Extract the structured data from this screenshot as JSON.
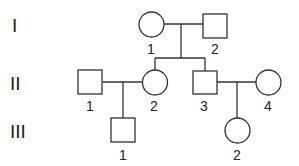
{
  "diagram": {
    "type": "pedigree",
    "colors": {
      "stroke": "#333333",
      "text": "#222222",
      "background": "#ffffff"
    },
    "generations": [
      {
        "label": "I"
      },
      {
        "label": "II"
      },
      {
        "label": "III"
      }
    ],
    "individuals": {
      "I_1": {
        "id": "1",
        "sex": "female",
        "generation": "I"
      },
      "I_2": {
        "id": "2",
        "sex": "male",
        "generation": "I"
      },
      "II_1": {
        "id": "1",
        "sex": "male",
        "generation": "II"
      },
      "II_2": {
        "id": "2",
        "sex": "female",
        "generation": "II"
      },
      "II_3": {
        "id": "3",
        "sex": "male",
        "generation": "II"
      },
      "II_4": {
        "id": "4",
        "sex": "female",
        "generation": "II"
      },
      "III_1": {
        "id": "1",
        "sex": "male",
        "generation": "III"
      },
      "III_2": {
        "id": "2",
        "sex": "female",
        "generation": "III"
      }
    },
    "relationships": [
      {
        "type": "couple",
        "partners": [
          "I_1",
          "I_2"
        ],
        "children": [
          "II_2",
          "II_3"
        ]
      },
      {
        "type": "couple",
        "partners": [
          "II_1",
          "II_2"
        ],
        "children": [
          "III_1"
        ]
      },
      {
        "type": "couple",
        "partners": [
          "II_3",
          "II_4"
        ],
        "children": [
          "III_2"
        ]
      }
    ]
  }
}
